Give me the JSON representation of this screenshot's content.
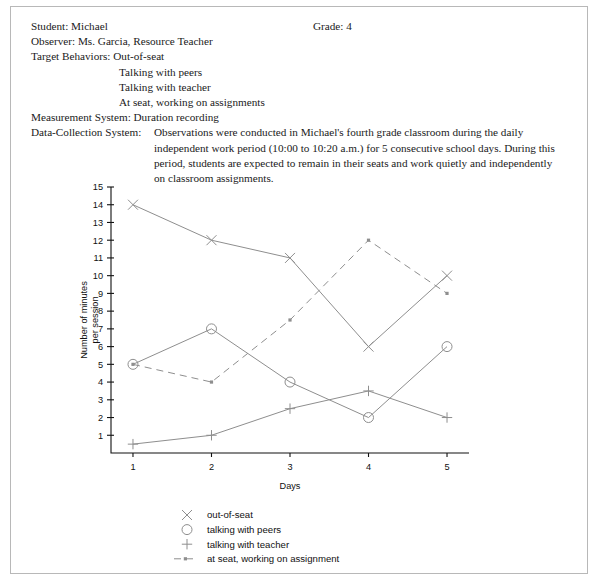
{
  "report": {
    "student_label": "Student: Michael",
    "grade_label": "Grade: 4",
    "observer_label": "Observer: Ms. Garcia, Resource Teacher",
    "target_behaviors_label": "Target Behaviors: Out-of-seat",
    "target_behaviors_items": [
      "Talking with peers",
      "Talking with teacher",
      "At seat, working on assignments"
    ],
    "measurement_system_label": "Measurement System: Duration recording",
    "data_collection_label": "Data-Collection System:",
    "data_collection_text": "Observations were conducted in Michael's fourth grade classroom during the daily independent work period (10:00 to 10:20 a.m.) for 5 consecutive school days. During this period, students are expected to remain in their seats and work quietly and independently on classroom assignments."
  },
  "chart_data": {
    "type": "line",
    "title": "",
    "xlabel": "Days",
    "ylabel": "Number of minutes\nper session",
    "ylabel_line1": "Number of minutes",
    "ylabel_line2": "per session",
    "x": [
      1,
      2,
      3,
      4,
      5
    ],
    "categories": [
      "1",
      "2",
      "3",
      "4",
      "5"
    ],
    "xtick_labels": [
      "1",
      "2",
      "3",
      "4",
      "5"
    ],
    "ytick_labels": [
      "1",
      "2",
      "3",
      "4",
      "5",
      "6",
      "7",
      "8",
      "9",
      "10",
      "11",
      "12",
      "13",
      "14",
      "15"
    ],
    "ylim": [
      0,
      15
    ],
    "xlim": [
      0.72,
      5.28
    ],
    "grid": false,
    "legend_position": "below-axes",
    "series": [
      {
        "name": "out-of-seat",
        "marker": "x",
        "linestyle": "solid",
        "color": "#8e8e8e",
        "values": [
          14,
          12,
          11,
          6,
          10
        ]
      },
      {
        "name": "talking with peers",
        "marker": "o",
        "linestyle": "solid",
        "color": "#8e8e8e",
        "values": [
          5,
          7,
          4,
          2,
          6
        ]
      },
      {
        "name": "talking with teacher",
        "marker": "+",
        "linestyle": "solid",
        "color": "#8e8e8e",
        "values": [
          0.5,
          1,
          2.5,
          3.5,
          2
        ]
      },
      {
        "name": "at seat, working on assignment",
        "marker": "dot",
        "linestyle": "dashed",
        "color": "#8e8e8e",
        "values": [
          5,
          4,
          7.5,
          12,
          9
        ]
      }
    ],
    "legend": [
      {
        "marker": "x",
        "label": "out-of-seat"
      },
      {
        "marker": "o",
        "label": "talking with peers"
      },
      {
        "marker": "+",
        "label": "talking with teacher"
      },
      {
        "marker": "dashed-line",
        "label": "at seat, working on assignment"
      }
    ]
  }
}
